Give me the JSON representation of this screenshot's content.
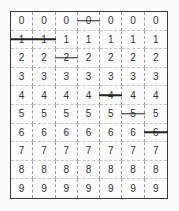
{
  "grid": {
    "columns": 7,
    "rows": [
      {
        "digit": "0",
        "struck_columns": [
          3
        ]
      },
      {
        "digit": "1",
        "struck_columns": [
          0,
          1
        ]
      },
      {
        "digit": "2",
        "struck_columns": [
          2
        ]
      },
      {
        "digit": "3",
        "struck_columns": []
      },
      {
        "digit": "4",
        "struck_columns": [
          4
        ]
      },
      {
        "digit": "5",
        "struck_columns": [
          5
        ]
      },
      {
        "digit": "6",
        "struck_columns": [
          6
        ]
      },
      {
        "digit": "7",
        "struck_columns": []
      },
      {
        "digit": "8",
        "struck_columns": []
      },
      {
        "digit": "9",
        "struck_columns": []
      }
    ]
  }
}
